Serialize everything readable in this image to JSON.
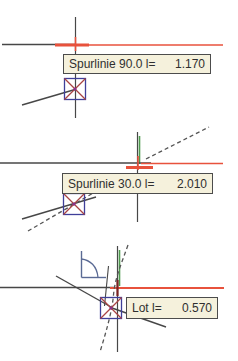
{
  "panels": [
    {
      "id": "spurlinie-90",
      "tooltip": {
        "label": "Spurlinie 90.0 l=",
        "value": "1.170"
      }
    },
    {
      "id": "spurlinie-30",
      "tooltip": {
        "label": "Spurlinie 30.0 l=",
        "value": "2.010"
      }
    },
    {
      "id": "lot",
      "tooltip": {
        "label": "Lot l=",
        "value": "0.570"
      }
    }
  ],
  "colors": {
    "track_red": "#e8523c",
    "line_dark": "#474747",
    "snap_green": "#4e9a4e",
    "marker_blue": "#3f3f99",
    "marker_cross_red": "#a84444",
    "marker_center_purple": "#8b2f8b",
    "tooltip_background": "#f5f1dc",
    "tooltip_border": "#4c4c4c",
    "perpendicular_icon_blue": "#5a6a94",
    "tick_maroon": "#7a2222"
  }
}
